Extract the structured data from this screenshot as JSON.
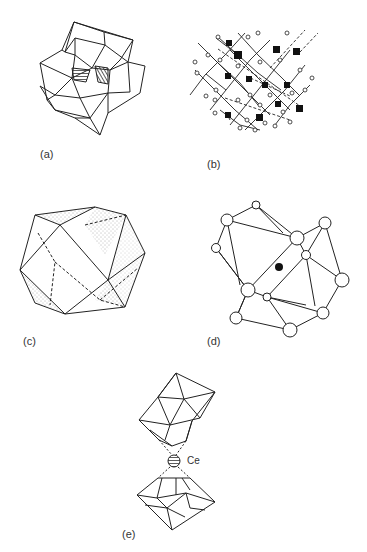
{
  "figure": {
    "panels": [
      {
        "id": "a",
        "label": "(a)",
        "description": "polyhedral cluster of octahedra with hatched faces"
      },
      {
        "id": "b",
        "label": "(b)",
        "description": "ball-and-stick lattice with filled and open atoms"
      },
      {
        "id": "c",
        "label": "(c)",
        "description": "cuboctahedron with shaded triangular faces"
      },
      {
        "id": "d",
        "label": "(d)",
        "description": "cuboctahedral cage of open spheres with central filled atom"
      },
      {
        "id": "e",
        "label": "(e)",
        "description": "two polyhedral caps coordinating a central Ce atom",
        "atom_label": "Ce"
      }
    ]
  }
}
